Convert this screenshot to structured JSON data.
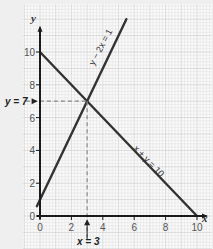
{
  "chart_data": {
    "type": "line",
    "title": "",
    "xlabel": "x",
    "ylabel": "y",
    "xlim": [
      0,
      10
    ],
    "ylim": [
      0,
      10
    ],
    "x_ticks": [
      0,
      2,
      4,
      6,
      8,
      10
    ],
    "y_ticks": [
      0,
      2,
      4,
      6,
      8,
      10
    ],
    "x_tick_labels": [
      "0",
      "2",
      "4",
      "6",
      "8",
      "10"
    ],
    "y_tick_labels": [
      "0",
      "2",
      "4",
      "6",
      "8",
      "10"
    ],
    "grid": true,
    "series": [
      {
        "name": "y - 2x = 1",
        "label": "y − 2x = 1",
        "points": [
          [
            -0.2,
            0.6
          ],
          [
            5.5,
            12
          ]
        ]
      },
      {
        "name": "x + y = 10",
        "label": "x + y = 10",
        "points": [
          [
            0,
            10
          ],
          [
            10,
            0
          ]
        ]
      }
    ],
    "intersection": {
      "x": 3,
      "y": 7
    },
    "annotations": {
      "y_marker": "y = 7",
      "x_marker": "x = 3"
    },
    "colors": {
      "line": "#333333",
      "axis": "#1a1a1a",
      "guide": "#888888",
      "grid_minor": "#e2e2e2",
      "grid_major": "#c8c8c8",
      "paper": "#fafafa",
      "background": "#efefef"
    }
  }
}
